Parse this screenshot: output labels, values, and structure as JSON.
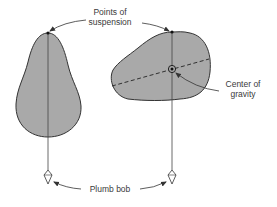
{
  "labels": {
    "suspension_line1": "Points of",
    "suspension_line2": "suspension",
    "cog_line1": "Center of",
    "cog_line2": "gravity",
    "plumb_bob": "Plumb bob"
  },
  "colors": {
    "shape_fill": "#a9a9a9",
    "outline": "#333333",
    "text": "#3a3a3a",
    "background": "#ffffff"
  }
}
